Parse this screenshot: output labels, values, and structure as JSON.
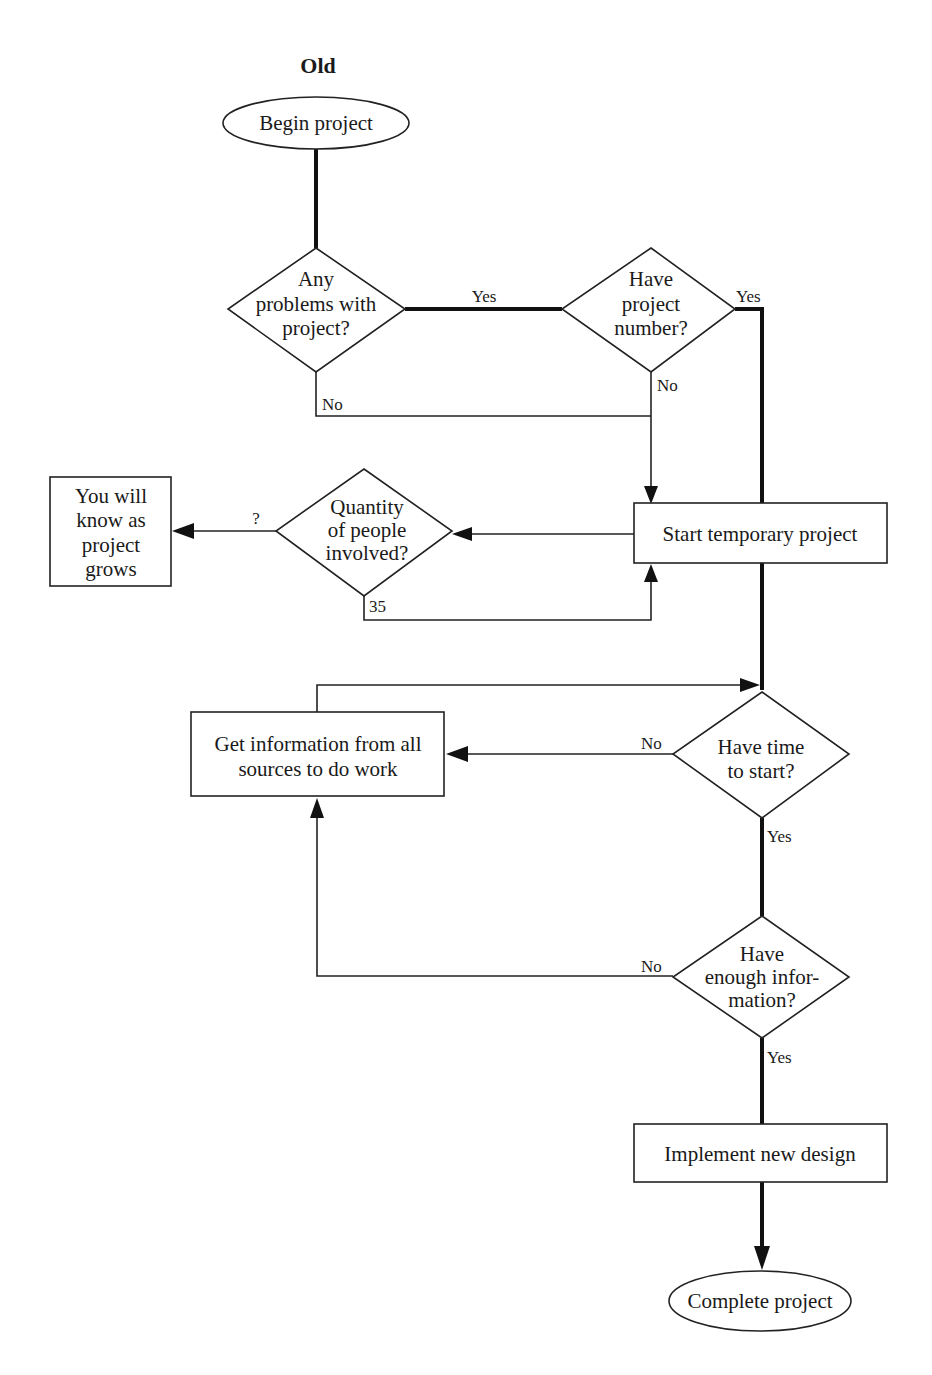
{
  "diagram": {
    "title": "Old",
    "nodes": {
      "begin": {
        "type": "terminator",
        "label": "Begin project"
      },
      "problems": {
        "type": "decision",
        "lines": [
          "Any",
          "problems with",
          "project?"
        ]
      },
      "project_number": {
        "type": "decision",
        "lines": [
          "Have",
          "project",
          "number?"
        ]
      },
      "start_temp": {
        "type": "process",
        "label": "Start temporary project"
      },
      "quantity": {
        "type": "decision",
        "lines": [
          "Quantity",
          "of people",
          "involved?"
        ]
      },
      "know_as_grows": {
        "type": "process",
        "lines": [
          "You will",
          "know as",
          "project",
          "grows"
        ]
      },
      "get_info": {
        "type": "process",
        "lines": [
          "Get information from all",
          "sources to do work"
        ]
      },
      "time_to_start": {
        "type": "decision",
        "lines": [
          "Have time",
          "to start?"
        ]
      },
      "enough_info": {
        "type": "decision",
        "lines": [
          "Have",
          "enough infor-",
          "mation?"
        ]
      },
      "implement": {
        "type": "process",
        "label": "Implement new design"
      },
      "complete": {
        "type": "terminator",
        "label": "Complete project"
      }
    },
    "edge_labels": {
      "problems_yes": "Yes",
      "problems_no": "No",
      "number_yes": "Yes",
      "number_no": "No",
      "quantity_unknown": "?",
      "quantity_35": "35",
      "time_no": "No",
      "time_yes": "Yes",
      "info_no": "No",
      "info_yes": "Yes"
    },
    "edges": [
      {
        "from": "begin",
        "to": "problems"
      },
      {
        "from": "problems",
        "to": "project_number",
        "label": "Yes"
      },
      {
        "from": "problems",
        "to": "start_temp",
        "label": "No"
      },
      {
        "from": "project_number",
        "to": "start_temp",
        "label": "No"
      },
      {
        "from": "project_number",
        "to": "time_to_start",
        "label": "Yes"
      },
      {
        "from": "start_temp",
        "to": "quantity"
      },
      {
        "from": "quantity",
        "to": "know_as_grows",
        "label": "?"
      },
      {
        "from": "quantity",
        "to": "start_temp",
        "label": "35"
      },
      {
        "from": "start_temp",
        "to": "time_to_start"
      },
      {
        "from": "time_to_start",
        "to": "get_info",
        "label": "No"
      },
      {
        "from": "get_info",
        "to": "time_to_start"
      },
      {
        "from": "time_to_start",
        "to": "enough_info",
        "label": "Yes"
      },
      {
        "from": "enough_info",
        "to": "get_info",
        "label": "No"
      },
      {
        "from": "enough_info",
        "to": "implement",
        "label": "Yes"
      },
      {
        "from": "implement",
        "to": "complete"
      }
    ]
  }
}
